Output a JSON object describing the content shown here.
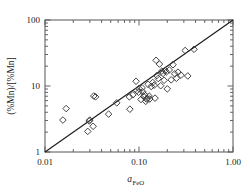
{
  "chart_data": {
    "type": "scatter",
    "title": "",
    "xlabel": "a_FeO",
    "xlabel_base": "a",
    "xlabel_sub": "FeO",
    "ylabel": "(%Mn)/[%Mn]",
    "xscale": "log",
    "yscale": "log",
    "xlim": [
      0.01,
      1.0
    ],
    "ylim": [
      1,
      100
    ],
    "xticks": [
      0.01,
      0.1,
      1.0
    ],
    "xticklabels": [
      "0.01",
      "0.10",
      "1.00"
    ],
    "yticks": [
      1,
      10,
      100
    ],
    "yticklabels": [
      "1",
      "10",
      "100"
    ],
    "grid": false,
    "legend": false,
    "marker": "open-diamond",
    "marker_color": "#3a3a3a",
    "marker_fill": "none",
    "frame_color": "#555555",
    "reference_line": {
      "label": "1:1 parity line",
      "x": [
        0.01,
        1.0
      ],
      "y": [
        1,
        100
      ],
      "color": "#1a1a1a"
    },
    "series": [
      {
        "name": "(%Mn)/[%Mn] vs a_FeO",
        "points": [
          [
            0.0155,
            3.05
          ],
          [
            0.0168,
            4.55
          ],
          [
            0.0285,
            2.05
          ],
          [
            0.0295,
            2.95
          ],
          [
            0.03,
            3.05
          ],
          [
            0.0325,
            2.45
          ],
          [
            0.033,
            7.05
          ],
          [
            0.0345,
            6.85
          ],
          [
            0.0475,
            3.75
          ],
          [
            0.058,
            5.55
          ],
          [
            0.079,
            6.85
          ],
          [
            0.08,
            4.45
          ],
          [
            0.086,
            7.35
          ],
          [
            0.093,
            11.8
          ],
          [
            0.095,
            8.55
          ],
          [
            0.099,
            8.05
          ],
          [
            0.1,
            9.15
          ],
          [
            0.105,
            6.25
          ],
          [
            0.108,
            9.35
          ],
          [
            0.11,
            8.15
          ],
          [
            0.112,
            6.95
          ],
          [
            0.115,
            7.35
          ],
          [
            0.118,
            5.85
          ],
          [
            0.12,
            6.35
          ],
          [
            0.123,
            6.45
          ],
          [
            0.125,
            10.6
          ],
          [
            0.128,
            7.05
          ],
          [
            0.13,
            6.35
          ],
          [
            0.135,
            9.85
          ],
          [
            0.14,
            11.3
          ],
          [
            0.145,
            10.3
          ],
          [
            0.148,
            6.55
          ],
          [
            0.152,
            24.5
          ],
          [
            0.155,
            14.4
          ],
          [
            0.16,
            13.0
          ],
          [
            0.165,
            21.5
          ],
          [
            0.17,
            10.1
          ],
          [
            0.175,
            16.8
          ],
          [
            0.18,
            15.5
          ],
          [
            0.185,
            12.2
          ],
          [
            0.19,
            17.2
          ],
          [
            0.195,
            16.3
          ],
          [
            0.2,
            9.05
          ],
          [
            0.21,
            17.5
          ],
          [
            0.22,
            12.4
          ],
          [
            0.23,
            21.0
          ],
          [
            0.24,
            15.3
          ],
          [
            0.25,
            13.1
          ],
          [
            0.26,
            16.2
          ],
          [
            0.28,
            14.6
          ],
          [
            0.31,
            34.5
          ],
          [
            0.33,
            14.2
          ],
          [
            0.385,
            36.0
          ]
        ]
      }
    ]
  },
  "axes": {
    "x_tick_labels": [
      "0.01",
      "0.10",
      "1.00"
    ],
    "y_tick_labels": [
      "100",
      "10",
      "1"
    ]
  }
}
